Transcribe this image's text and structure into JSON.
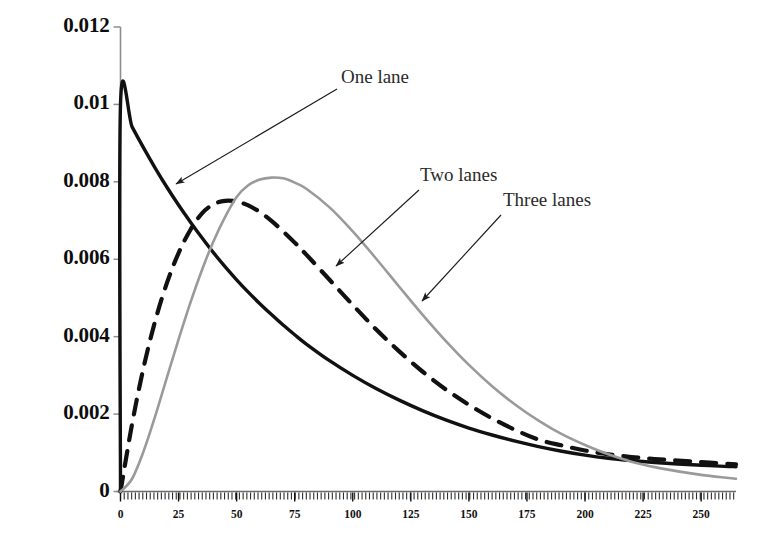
{
  "chart_data": {
    "type": "line",
    "title": "",
    "xlabel": "",
    "ylabel": "",
    "xlim": [
      0,
      265
    ],
    "ylim": [
      0,
      0.012
    ],
    "grid": false,
    "legend_position": "inline-annotations",
    "y_ticks": [
      "0",
      "0.002",
      "0.004",
      "0.006",
      "0.008",
      "0.01",
      "0.012"
    ],
    "y_tick_values": [
      0,
      0.002,
      0.004,
      0.006,
      0.008,
      0.01,
      0.012
    ],
    "x_ticks": [
      "0",
      "25",
      "50",
      "75",
      "100",
      "125",
      "150",
      "175",
      "200",
      "225",
      "250"
    ],
    "x_tick_values": [
      0,
      25,
      50,
      75,
      100,
      125,
      150,
      175,
      200,
      225,
      250
    ],
    "minor_ticks_x": true,
    "series": [
      {
        "name": "One lane",
        "style": "solid",
        "color": "#111111",
        "width": 3.4,
        "x": [
          0,
          0,
          5,
          10,
          15,
          20,
          25,
          30,
          35,
          40,
          45,
          50,
          55,
          60,
          65,
          70,
          75,
          80,
          90,
          100,
          110,
          120,
          130,
          140,
          150,
          160,
          170,
          180,
          190,
          200,
          210,
          220,
          230,
          240,
          250,
          260,
          265
        ],
        "y": [
          0,
          0.01,
          0.00942,
          0.00887,
          0.00835,
          0.00786,
          0.0074,
          0.00697,
          0.00656,
          0.00617,
          0.00581,
          0.00547,
          0.00515,
          0.00485,
          0.00457,
          0.0043,
          0.00405,
          0.00381,
          0.00338,
          0.003,
          0.00266,
          0.00236,
          0.00209,
          0.00185,
          0.00164,
          0.00146,
          0.0013,
          0.00116,
          0.00104,
          0.00094,
          0.00086,
          0.0008,
          0.00075,
          0.00071,
          0.00068,
          0.00065,
          0.00064
        ]
      },
      {
        "name": "Two lanes",
        "style": "dashed",
        "color": "#111111",
        "width": 4.2,
        "x": [
          0,
          5,
          10,
          15,
          20,
          25,
          30,
          35,
          40,
          45,
          50,
          55,
          60,
          65,
          70,
          75,
          80,
          90,
          100,
          110,
          120,
          130,
          140,
          150,
          160,
          170,
          180,
          190,
          200,
          210,
          220,
          230,
          240,
          250,
          260,
          265
        ],
        "y": [
          0,
          0.00175,
          0.00322,
          0.00442,
          0.00539,
          0.00616,
          0.00675,
          0.00718,
          0.00742,
          0.00751,
          0.00749,
          0.00739,
          0.00722,
          0.00699,
          0.00672,
          0.00643,
          0.00612,
          0.00547,
          0.00482,
          0.00419,
          0.00362,
          0.0031,
          0.00264,
          0.00224,
          0.00189,
          0.00159,
          0.00134,
          0.00119,
          0.00106,
          0.00096,
          0.00089,
          0.00084,
          0.0008,
          0.00076,
          0.00072,
          0.0007
        ]
      },
      {
        "name": "Three lanes",
        "style": "solid",
        "color": "#9a9a9a",
        "width": 2.6,
        "x": [
          0,
          5,
          10,
          15,
          20,
          25,
          30,
          35,
          40,
          45,
          50,
          55,
          60,
          65,
          70,
          75,
          80,
          90,
          100,
          110,
          120,
          130,
          140,
          150,
          160,
          170,
          180,
          190,
          200,
          210,
          220,
          230,
          240,
          250,
          260,
          265
        ],
        "y": [
          0,
          0.00033,
          0.00105,
          0.00196,
          0.00295,
          0.00393,
          0.00486,
          0.00571,
          0.00646,
          0.00709,
          0.00761,
          0.00791,
          0.00806,
          0.00811,
          0.00809,
          0.00798,
          0.00782,
          0.00734,
          0.00672,
          0.00602,
          0.00529,
          0.00457,
          0.00389,
          0.00327,
          0.00272,
          0.00224,
          0.00183,
          0.00148,
          0.0012,
          0.00096,
          0.00077,
          0.00063,
          0.00052,
          0.00043,
          0.00036,
          0.00033
        ]
      }
    ],
    "annotations": [
      {
        "text": "One lane",
        "label_x": 341,
        "label_y": 80,
        "arrow_from_x": 337,
        "arrow_from_y": 89,
        "arrow_to_x": 176,
        "arrow_to_y": 184
      },
      {
        "text": "Two lanes",
        "label_x": 420,
        "label_y": 178,
        "arrow_from_x": 419,
        "arrow_from_y": 190,
        "arrow_to_x": 336,
        "arrow_to_y": 266
      },
      {
        "text": "Three lanes",
        "label_x": 503,
        "label_y": 203,
        "arrow_from_x": 501,
        "arrow_from_y": 215,
        "arrow_to_x": 422,
        "arrow_to_y": 301
      }
    ]
  }
}
